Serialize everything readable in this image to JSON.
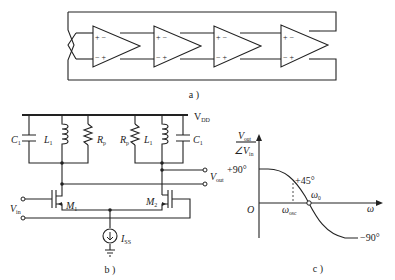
{
  "panel_a": {
    "caption": "a )",
    "stage_count": 4,
    "input_signs_top": "+ −",
    "input_signs_bottom": "− +"
  },
  "panel_b": {
    "caption": "b )",
    "supply": "V",
    "supply_sub": "DD",
    "c_left": "C",
    "c_left_sub": "1",
    "l_left": "L",
    "l_left_sub": "1",
    "r_left": "R",
    "r_left_sub": "p",
    "r_right": "R",
    "r_right_sub": "p",
    "l_right": "L",
    "l_right_sub": "1",
    "c_right": "C",
    "c_right_sub": "1",
    "m1": "M",
    "m1_sub": "1",
    "m2": "M",
    "m2_sub": "2",
    "vin": "V",
    "vin_sub": "in",
    "vout": "V",
    "vout_sub": "out",
    "iss": "I",
    "iss_sub": "SS"
  },
  "panel_c": {
    "caption": "c )",
    "ylabel_top": "V",
    "ylabel_top_sub": "out",
    "ylabel_bottom": "∠V",
    "ylabel_bottom_sub": "in",
    "xlabel": "ω",
    "origin": "O",
    "plus90": "+90°",
    "plus45": "+45°",
    "minus90": "−90°",
    "omega0": "ω",
    "omega0_sub": "0",
    "omega_osc": "ω",
    "omega_osc_sub": "osc"
  }
}
